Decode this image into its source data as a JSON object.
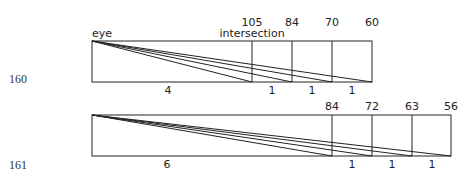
{
  "figures": [
    {
      "number": "160",
      "eye_label": "eye",
      "intersection_label": "intersection",
      "top_labels": [
        "105",
        "84",
        "70",
        "60"
      ],
      "bottom_labels": [
        "4",
        "1",
        "1",
        "1"
      ]
    },
    {
      "number": "161",
      "top_labels": [
        "84",
        "72",
        "63",
        "56"
      ],
      "bottom_labels": [
        "6",
        "1",
        "1",
        "1"
      ]
    }
  ]
}
